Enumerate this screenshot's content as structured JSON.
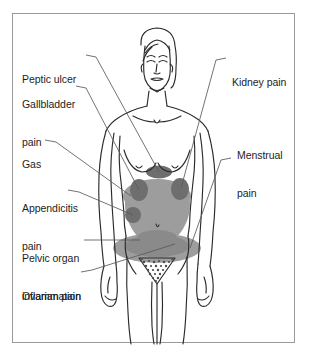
{
  "diagram": {
    "frame": {
      "border_color": "#9a9a9a",
      "background": "#ffffff"
    },
    "colors": {
      "outline": "#2b2b2b",
      "label_text": "#1d1d1d",
      "leader_line": "#5a5a5a",
      "pain_spot_dark": "#6e6e6e",
      "pain_zone_light": "#9d9d9d",
      "pain_zone_mid": "#8a8a8a"
    },
    "labels_left": [
      {
        "name": "peptic-ulcer",
        "text": "Peptic ulcer",
        "lines": [
          "Peptic ulcer"
        ]
      },
      {
        "name": "gallbladder-pain",
        "text": "Gallbladder pain",
        "lines": [
          "Gallbladder",
          "pain"
        ]
      },
      {
        "name": "gas",
        "text": "Gas",
        "lines": [
          "Gas"
        ]
      },
      {
        "name": "appendicitis-pain",
        "text": "Appendicitis pain",
        "lines": [
          "Appendicitis",
          "pain"
        ]
      },
      {
        "name": "pelvic-organ-inflammation",
        "text": "Pelvic organ inflammation",
        "lines": [
          "Pelvic organ",
          "inflammation"
        ]
      },
      {
        "name": "ovarian-pain",
        "text": "Ovarian pain",
        "lines": [
          "Ovarian pain"
        ]
      }
    ],
    "labels_right": [
      {
        "name": "kidney-pain",
        "text": "Kidney pain",
        "lines": [
          "Kidney pain"
        ]
      },
      {
        "name": "menstrual-pain",
        "text": "Menstrual pain",
        "lines": [
          "Menstrual",
          "pain"
        ]
      }
    ],
    "pain_regions": [
      {
        "name": "epigastric-spot",
        "label_ref": "peptic-ulcer",
        "shade": "dark"
      },
      {
        "name": "gallbladder-spot",
        "label_ref": "gallbladder-pain",
        "shade": "dark"
      },
      {
        "name": "upper-abdomen-zone",
        "label_ref": "gas",
        "shade": "light"
      },
      {
        "name": "appendix-spot",
        "label_ref": "appendicitis-pain",
        "shade": "dark"
      },
      {
        "name": "kidney-spot",
        "label_ref": "kidney-pain",
        "shade": "dark"
      },
      {
        "name": "pelvic-zone",
        "label_ref": "pelvic-organ-inflammation",
        "shade": "light"
      },
      {
        "name": "ovary-zone",
        "label_ref": "ovarian-pain",
        "shade": "mid"
      },
      {
        "name": "lower-pelvic-zone",
        "label_ref": "menstrual-pain",
        "shade": "light"
      }
    ]
  }
}
